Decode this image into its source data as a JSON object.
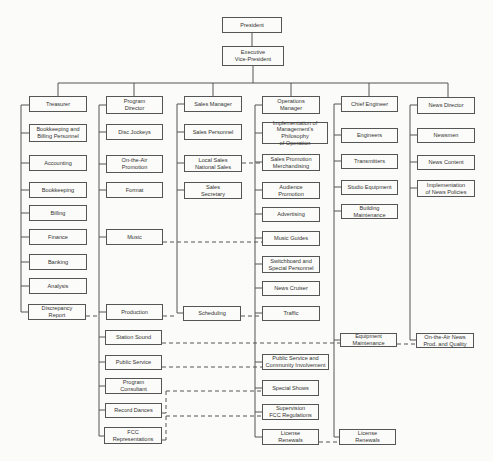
{
  "diagram": {
    "type": "org-chart",
    "nodes": {
      "president": {
        "label": "President",
        "x": 222,
        "y": 17,
        "w": 60,
        "h": 16
      },
      "evp": {
        "label": "Executive\nVice-President",
        "x": 222,
        "y": 46,
        "w": 62,
        "h": 20
      },
      "treasurer": {
        "label": "Treasurer",
        "x": 29,
        "y": 96,
        "w": 58,
        "h": 16
      },
      "bookkeeping_billing": {
        "label": "Bookkeeping and\nBilling Personnel",
        "x": 29,
        "y": 124,
        "w": 58,
        "h": 18
      },
      "accounting": {
        "label": "Accounting",
        "x": 29,
        "y": 155,
        "w": 58,
        "h": 16
      },
      "bookkeeping": {
        "label": "Bookkeeping",
        "x": 29,
        "y": 182,
        "w": 58,
        "h": 16
      },
      "billing": {
        "label": "Billing",
        "x": 29,
        "y": 205,
        "w": 58,
        "h": 16
      },
      "finance": {
        "label": "Finance",
        "x": 29,
        "y": 229,
        "w": 58,
        "h": 16
      },
      "banking": {
        "label": "Banking",
        "x": 29,
        "y": 254,
        "w": 58,
        "h": 16
      },
      "analysis": {
        "label": "Analysis",
        "x": 29,
        "y": 278,
        "w": 58,
        "h": 16
      },
      "discrepancy": {
        "label": "Discrepancy\nReport",
        "x": 28,
        "y": 304,
        "w": 58,
        "h": 16
      },
      "program_director": {
        "label": "Program\nDirector",
        "x": 106,
        "y": 96,
        "w": 57,
        "h": 18
      },
      "disc_jockeys": {
        "label": "Disc Jockeys",
        "x": 106,
        "y": 124,
        "w": 57,
        "h": 16
      },
      "on_air_promo": {
        "label": "On-the-Air\nPromotion",
        "x": 106,
        "y": 155,
        "w": 57,
        "h": 18
      },
      "format": {
        "label": "Format",
        "x": 106,
        "y": 182,
        "w": 57,
        "h": 16
      },
      "music": {
        "label": "Music",
        "x": 106,
        "y": 229,
        "w": 57,
        "h": 16
      },
      "production": {
        "label": "Production",
        "x": 106,
        "y": 304,
        "w": 57,
        "h": 16
      },
      "station_sound": {
        "label": "Station Sound",
        "x": 105,
        "y": 330,
        "w": 57,
        "h": 15
      },
      "public_service": {
        "label": "Public Service",
        "x": 105,
        "y": 355,
        "w": 57,
        "h": 15
      },
      "program_consultant": {
        "label": "Program\nConsultant",
        "x": 105,
        "y": 378,
        "w": 57,
        "h": 16
      },
      "record_dances": {
        "label": "Record Dances",
        "x": 105,
        "y": 403,
        "w": 57,
        "h": 15
      },
      "fcc_reps": {
        "label": "FCC\nRepresentations",
        "x": 104,
        "y": 427,
        "w": 58,
        "h": 17
      },
      "sales_manager": {
        "label": "Sales Manager",
        "x": 184,
        "y": 96,
        "w": 58,
        "h": 16
      },
      "sales_personnel": {
        "label": "Sales Personnel",
        "x": 184,
        "y": 124,
        "w": 58,
        "h": 16
      },
      "local_sales": {
        "label": "Local Sales\nNational Sales",
        "x": 184,
        "y": 155,
        "w": 58,
        "h": 17
      },
      "sales_secretary": {
        "label": "Sales\nSecretary",
        "x": 184,
        "y": 182,
        "w": 58,
        "h": 17
      },
      "scheduling": {
        "label": "Scheduling",
        "x": 183,
        "y": 306,
        "w": 58,
        "h": 15
      },
      "ops_manager": {
        "label": "Operations\nManager",
        "x": 262,
        "y": 96,
        "w": 58,
        "h": 18
      },
      "implementation_mgmt": {
        "label": "Implementation of\nManagement's Philosophy\nof Operation",
        "x": 262,
        "y": 122,
        "w": 66,
        "h": 22
      },
      "sales_promo": {
        "label": "Sales Promotion\nMerchandising",
        "x": 262,
        "y": 154,
        "w": 58,
        "h": 17
      },
      "audience_promo": {
        "label": "Audience\nPromotion",
        "x": 262,
        "y": 182,
        "w": 58,
        "h": 17
      },
      "advertising": {
        "label": "Advertising",
        "x": 262,
        "y": 207,
        "w": 58,
        "h": 15
      },
      "music_guides": {
        "label": "Music Guides",
        "x": 262,
        "y": 231,
        "w": 58,
        "h": 15
      },
      "switchboard": {
        "label": "Switchboard and\nSpecial Personnel",
        "x": 262,
        "y": 256,
        "w": 58,
        "h": 17
      },
      "news_cruiser": {
        "label": "News Cruiser",
        "x": 262,
        "y": 281,
        "w": 58,
        "h": 15
      },
      "traffic": {
        "label": "Traffic",
        "x": 262,
        "y": 306,
        "w": 58,
        "h": 15
      },
      "community": {
        "label": "Public Service and\nCommunity Involvement",
        "x": 262,
        "y": 354,
        "w": 67,
        "h": 16
      },
      "special_shows": {
        "label": "Special Shows",
        "x": 262,
        "y": 380,
        "w": 57,
        "h": 16
      },
      "supervision_fcc": {
        "label": "Supervision\nFCC Regulations",
        "x": 262,
        "y": 404,
        "w": 57,
        "h": 16
      },
      "license_renewals_ops": {
        "label": "License\nRenewals",
        "x": 262,
        "y": 429,
        "w": 57,
        "h": 16
      },
      "chief_engineer": {
        "label": "Chief Engineer",
        "x": 341,
        "y": 96,
        "w": 57,
        "h": 16
      },
      "engineers": {
        "label": "Engineers",
        "x": 341,
        "y": 128,
        "w": 57,
        "h": 15
      },
      "transmitters": {
        "label": "Transmitters",
        "x": 341,
        "y": 154,
        "w": 57,
        "h": 15
      },
      "studio_equipment": {
        "label": "Studio Equipment",
        "x": 341,
        "y": 180,
        "w": 57,
        "h": 15
      },
      "building_maintenance": {
        "label": "Building\nMaintenance",
        "x": 341,
        "y": 204,
        "w": 57,
        "h": 15
      },
      "equipment_maintenance": {
        "label": "Equipment\nMaintenance",
        "x": 340,
        "y": 333,
        "w": 57,
        "h": 14
      },
      "license_renewals_eng": {
        "label": "License\nRenewals",
        "x": 339,
        "y": 429,
        "w": 57,
        "h": 16
      },
      "news_director": {
        "label": "News Director",
        "x": 417,
        "y": 97,
        "w": 58,
        "h": 17
      },
      "newsmen": {
        "label": "Newsmen",
        "x": 417,
        "y": 128,
        "w": 58,
        "h": 15
      },
      "news_content": {
        "label": "News Content",
        "x": 417,
        "y": 155,
        "w": 58,
        "h": 15
      },
      "news_policies": {
        "label": "Implementation\nof News Policies",
        "x": 417,
        "y": 180,
        "w": 58,
        "h": 17
      },
      "on_air_news": {
        "label": "On-the-Air News\nProd. and Quality",
        "x": 416,
        "y": 333,
        "w": 58,
        "h": 15
      }
    }
  }
}
